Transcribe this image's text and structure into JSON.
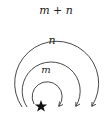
{
  "diagram": {
    "title": "",
    "labels": {
      "outer": "m + n",
      "middle": "n",
      "inner": "m"
    },
    "start_marker": "star",
    "arcs": [
      {
        "name": "outer-arc",
        "label": "m + n",
        "direction": "clockwise"
      },
      {
        "name": "middle-arc",
        "label": "n",
        "direction": "clockwise"
      },
      {
        "name": "inner-arc",
        "label": "m",
        "direction": "clockwise"
      }
    ],
    "colors": {
      "stroke": "#333333",
      "star": "#111111",
      "background": "#ffffff"
    }
  }
}
